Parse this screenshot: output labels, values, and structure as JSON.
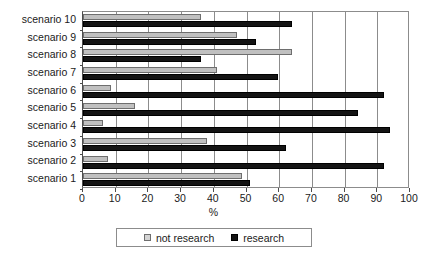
{
  "chart_data": {
    "type": "bar",
    "orientation": "horizontal",
    "title": "",
    "xlabel": "%",
    "ylabel": "",
    "xlim": [
      0,
      100
    ],
    "xticks": [
      0,
      10,
      20,
      30,
      40,
      50,
      60,
      70,
      80,
      90,
      100
    ],
    "xtick_labels": [
      "0",
      "10",
      "20",
      "30",
      "40",
      "50",
      "60",
      "70",
      "80",
      "90",
      "100"
    ],
    "grid": true,
    "grid_axis": "x",
    "legend_position": "bottom",
    "categories": [
      "scenario 10",
      "scenario 9",
      "scenario 8",
      "scenario 7",
      "scenario 6",
      "scenario 5",
      "scenario 4",
      "scenario 3",
      "scenario 2",
      "scenario 1"
    ],
    "series": [
      {
        "name": "not research",
        "color": "#c0c0c0",
        "values": [
          36,
          47,
          64,
          41,
          8.5,
          16,
          6,
          38,
          7.5,
          48.5
        ]
      },
      {
        "name": "research",
        "color": "#141414",
        "values": [
          64,
          53,
          36,
          59.5,
          92,
          84,
          94,
          62,
          92,
          51
        ]
      }
    ]
  },
  "legend": {
    "entries": [
      {
        "label": "not research",
        "swatch": "light-gray-square-icon"
      },
      {
        "label": "research",
        "swatch": "black-square-icon"
      }
    ]
  },
  "colors": {
    "not_research": "#c0c0c0",
    "research": "#141414",
    "axis": "#4d4d4d",
    "grid": "#8c8c8c",
    "background": "#ffffff"
  }
}
